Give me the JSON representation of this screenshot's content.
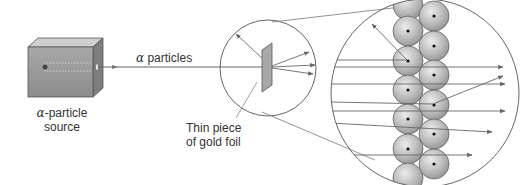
{
  "labels": {
    "source_symbol": "α",
    "source_line1": "-particle",
    "source_line2": "source",
    "beam_symbol": "α",
    "beam_text": " particles",
    "foil_line1": "Thin piece",
    "foil_line2": "of gold foil"
  },
  "colors": {
    "line": "#666666",
    "atom_fill": "#b8b8b8",
    "atom_highlight": "#e6e6e6",
    "nucleus": "#111111",
    "box_front": "#9a9a9a",
    "box_top": "#cfcfcf",
    "box_side": "#7d7d7d",
    "foil": "#a8a8a8"
  },
  "components": [
    {
      "id": "alpha-source",
      "description": "Lead box emitting alpha particle beam"
    },
    {
      "id": "beam",
      "description": "Straight beam of alpha particles"
    },
    {
      "id": "foil-view",
      "description": "Circle showing thin gold foil with scattered particles"
    },
    {
      "id": "atomic-view",
      "description": "Magnified view of gold atoms with nuclei and particle paths"
    }
  ]
}
